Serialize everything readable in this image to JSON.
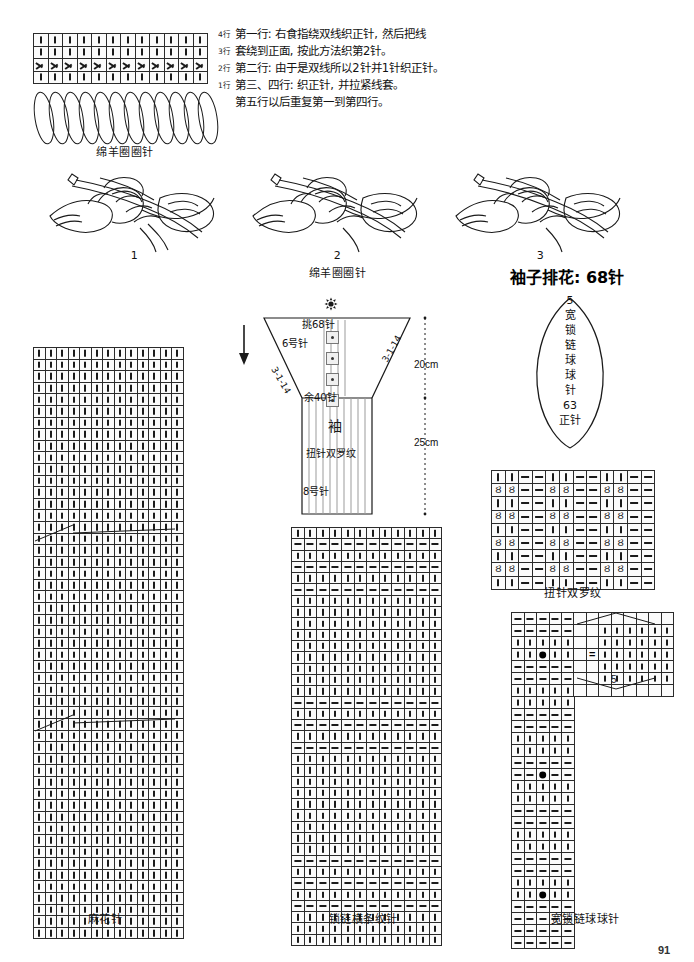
{
  "page": {
    "number": "91",
    "language": "zh-CN"
  },
  "instructions": {
    "row_labels": [
      "4行",
      "3行",
      "2行",
      "1行"
    ],
    "lines": [
      "第一行: 右食指绕双线织正针, 然后把线",
      "套绕到正面, 按此方法织第2针。",
      "第二行: 由于是双线所以2针并1针织正针。",
      "第三、四行: 织正针, 并拉紧线套。",
      "第五行以后重复第一到第四行。"
    ]
  },
  "charts": {
    "sheep_loop": {
      "caption": "绵羊圈圈针",
      "columns": 12,
      "rows": 4,
      "row_patterns": [
        "knit",
        "knit",
        "loop",
        "stem"
      ],
      "loop_count": 12
    },
    "cable": {
      "caption": "麻花针",
      "columns": 13,
      "rows": 51,
      "cable_cross_rows": [
        17,
        36
      ],
      "default_symbol": "knit"
    },
    "chain_stripe": {
      "caption": "锁链横条纹针",
      "columns": 12,
      "rows": 37,
      "purl_rows": [
        1,
        3,
        5,
        15,
        17,
        19,
        29,
        31,
        33
      ],
      "default_symbol": "knit"
    },
    "wide_chain_bobble": {
      "caption": "宽锁链球球针",
      "columns": 5,
      "rows": 28,
      "legend_columns": 6,
      "legend_rows": 7,
      "legend_label": "5",
      "equals_symbol": "=",
      "bobble_cells": [
        [
          3,
          2
        ],
        [
          3,
          5
        ],
        [
          13,
          2
        ],
        [
          23,
          2
        ]
      ],
      "purl_rows": [
        0,
        1,
        4,
        5,
        8,
        9,
        12,
        13,
        16,
        17,
        20,
        21,
        24,
        25,
        26,
        27
      ]
    },
    "twisted_rib": {
      "caption": "扭针双罗纹",
      "columns": 12,
      "rows": 9,
      "twist_glyph": "Ȣ",
      "repeat": "2 knit / 2 purl"
    }
  },
  "illustrations": {
    "steps": [
      {
        "number": "1",
        "caption": ""
      },
      {
        "number": "2",
        "caption": "绵羊圈圈针"
      },
      {
        "number": "3",
        "caption": ""
      }
    ]
  },
  "sleeve_schematic": {
    "top_count": "挑68针",
    "needle_top": "6号针",
    "decrease_left": "3-1-14",
    "decrease_right": "3-1-14",
    "remaining": "余40针",
    "body_label": "袖",
    "body_pattern": "扭针双罗纹",
    "needle_bottom": "8号针",
    "measure_top": "20cm",
    "measure_bottom": "25cm"
  },
  "sleeve_arrangement": {
    "title": "袖子排花: 68针",
    "top_number": "5",
    "vertical_label": [
      "宽",
      "锁",
      "链",
      "球",
      "球",
      "针"
    ],
    "bottom_number": "63",
    "bottom_label": "正针"
  }
}
